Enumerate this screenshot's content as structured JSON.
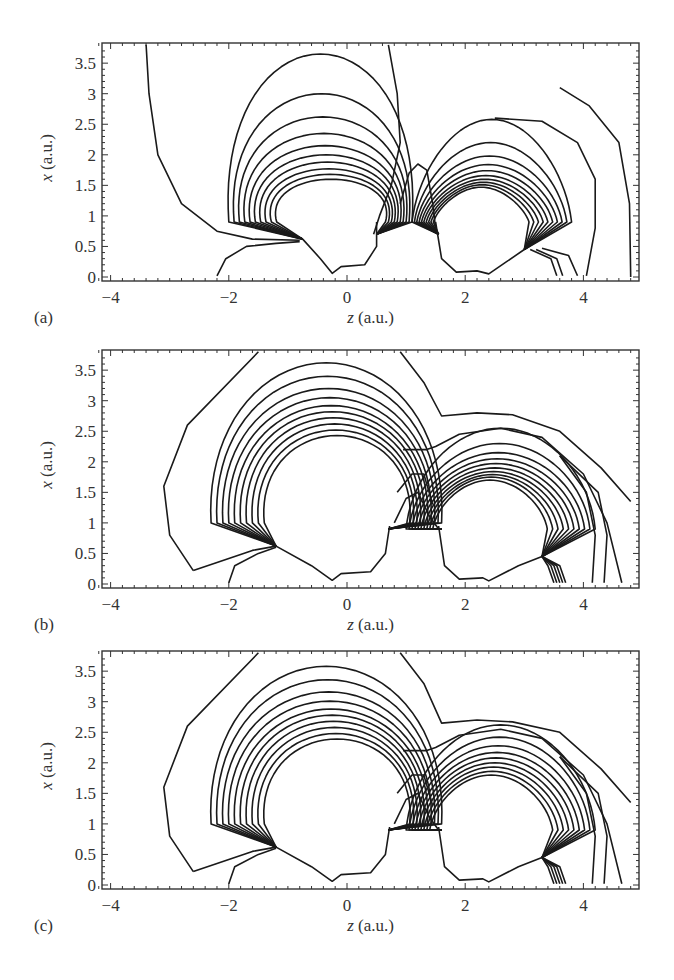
{
  "figure": {
    "panels": [
      {
        "label": "(a)",
        "top": 0
      },
      {
        "label": "(b)",
        "top": 307
      },
      {
        "label": "(c)",
        "top": 608
      }
    ],
    "xlabel_italic": "z",
    "xlabel_unit": " (a.u.)",
    "ylabel_italic": "x",
    "ylabel_unit": " (a.u.)",
    "xticks": [
      "−4",
      "−2",
      "0",
      "2",
      "4"
    ],
    "yticks": [
      "0",
      "0.5",
      "1",
      "1.5",
      "2",
      "2.5",
      "3",
      "3.5"
    ],
    "line_color": "#1a1a1a",
    "frame_color": "#333333"
  },
  "chart_data": [
    {
      "type": "contour",
      "title": "(a)",
      "xlabel": "z (a.u.)",
      "ylabel": "x (a.u.)",
      "xlim": [
        -4.2,
        4.9
      ],
      "ylim": [
        -0.05,
        3.85
      ],
      "xticks": [
        -4,
        -2,
        0,
        2,
        4
      ],
      "yticks": [
        0,
        0.5,
        1,
        1.5,
        2,
        2.5,
        3,
        3.5
      ],
      "grid": false,
      "description": "Field-line contours around two nuclei near z≈0 and z≈2.4 on axis; left family peaks at x≈3.7, right family peaks at x≈2.6; separatrix bump at z≈1.2, x≈1.85"
    },
    {
      "type": "contour",
      "title": "(b)",
      "xlabel": "z (a.u.)",
      "ylabel": "x (a.u.)",
      "xlim": [
        -4.2,
        4.9
      ],
      "ylim": [
        -0.05,
        3.85
      ],
      "xticks": [
        -4,
        -2,
        0,
        2,
        4
      ],
      "yticks": [
        0,
        0.5,
        1,
        1.5,
        2,
        2.5,
        3,
        3.5
      ],
      "grid": false,
      "description": "Contours enclosing both centers; outer line dips to x≈2.75 near z≈1.6, inner left family top x≈3.6, right family top x≈2.55"
    },
    {
      "type": "contour",
      "title": "(c)",
      "xlabel": "z (a.u.)",
      "ylabel": "x (a.u.)",
      "xlim": [
        -4.2,
        4.9
      ],
      "ylim": [
        -0.05,
        3.85
      ],
      "xticks": [
        -4,
        -2,
        0,
        2,
        4
      ],
      "yticks": [
        0,
        0.5,
        1,
        1.5,
        2,
        2.5,
        3,
        3.5
      ],
      "grid": false,
      "description": "Similar to (b); outermost contour dips to x≈2.65 near z≈1.6 and peaks x≈2.95 at z≈2.6"
    }
  ]
}
